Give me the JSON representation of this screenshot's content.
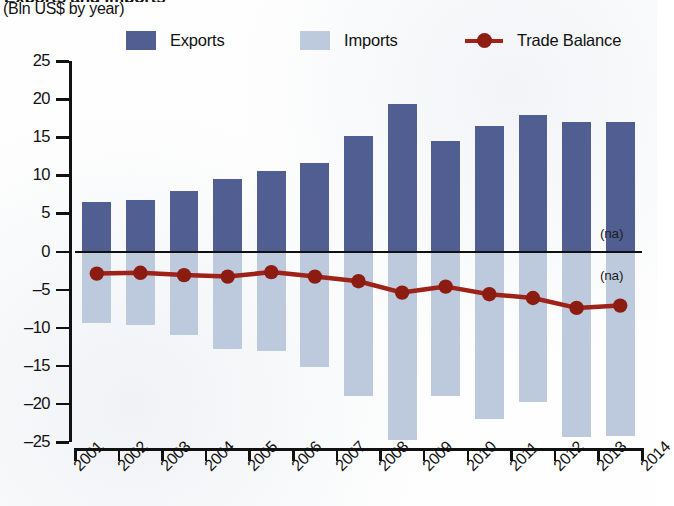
{
  "title_cut": "Exports and Imports",
  "subtitle": "(Bln US$ by year)",
  "legend": {
    "exports": {
      "label": "Exports",
      "color": "#515e91",
      "icon": "square-swatch-icon"
    },
    "imports": {
      "label": "Imports",
      "color": "#bdcadd",
      "icon": "square-swatch-icon"
    },
    "balance": {
      "label": "Trade Balance",
      "color": "#9e2218",
      "icon": "line-marker-icon"
    }
  },
  "annotations": [
    {
      "text": "(na)",
      "x": 600,
      "y": 226
    },
    {
      "text": "(na)",
      "x": 600,
      "y": 268
    }
  ],
  "chart_data": {
    "type": "bar",
    "title": "Exports and Imports",
    "subtitle": "(Bln US$ by year)",
    "xlabel": "",
    "ylabel": "",
    "ylim": [
      -25,
      25
    ],
    "yticks": [
      25,
      20,
      15,
      10,
      5,
      0,
      -5,
      -10,
      -15,
      -20,
      -25
    ],
    "ytick_labels": [
      "25",
      "20",
      "15",
      "10",
      "5",
      "0",
      "–5",
      "–10",
      "–15",
      "–20",
      "–25"
    ],
    "grid": false,
    "legend_position": "top",
    "categories": [
      "2001",
      "2002",
      "2003",
      "2004",
      "2005",
      "2006",
      "2007",
      "2008",
      "2009",
      "2010",
      "2011",
      "2012",
      "2013"
    ],
    "xtick_labels": [
      "2001",
      "2002",
      "2003",
      "2004",
      "2005",
      "2006",
      "2007",
      "2008",
      "2009",
      "2010",
      "2011",
      "2012",
      "2013",
      "2014"
    ],
    "series": [
      {
        "name": "Exports",
        "type": "bar",
        "color": "#515e91",
        "values": [
          6.5,
          6.8,
          7.9,
          9.5,
          10.5,
          11.6,
          15.1,
          19.3,
          14.5,
          16.5,
          17.9,
          17.0,
          17.0
        ]
      },
      {
        "name": "Imports",
        "type": "bar",
        "color": "#bdcadd",
        "values": [
          -9.4,
          -9.6,
          -11.0,
          -12.8,
          -13.0,
          -15.2,
          -19.0,
          -24.7,
          -19.0,
          -22.0,
          -19.8,
          -24.4,
          -24.2
        ]
      },
      {
        "name": "Trade Balance",
        "type": "line",
        "color": "#9e2218",
        "values": [
          -2.9,
          -2.8,
          -3.1,
          -3.3,
          -2.7,
          -3.3,
          -3.9,
          -5.4,
          -4.6,
          -5.6,
          -6.1,
          -7.4,
          -7.1
        ]
      }
    ]
  }
}
